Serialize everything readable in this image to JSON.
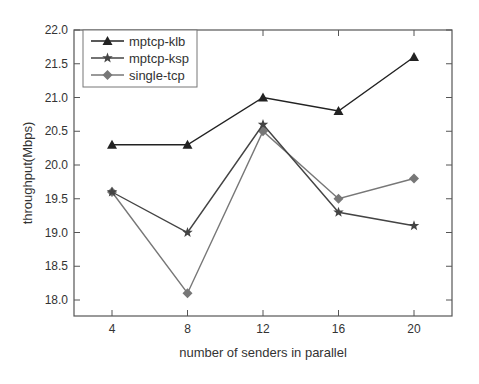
{
  "chart_data": {
    "type": "line",
    "title": "",
    "xlabel": "number of senders in parallel",
    "ylabel": "throughput(Mbps)",
    "x": [
      4,
      8,
      12,
      16,
      20
    ],
    "x_tick_labels": [
      "4",
      "8",
      "12",
      "16",
      "20"
    ],
    "y_tick_labels": [
      "18.0",
      "18.5",
      "19.0",
      "19.5",
      "20.0",
      "20.5",
      "21.0",
      "21.5",
      "22.0"
    ],
    "y_ticks": [
      18.0,
      18.5,
      19.0,
      19.5,
      20.0,
      20.5,
      21.0,
      21.5,
      22.0
    ],
    "xlim": [
      1,
      23
    ],
    "ylim": [
      17.76,
      22.0
    ],
    "grid": false,
    "legend_position": "upper-left",
    "series": [
      {
        "name": "mptcp-klb",
        "marker": "triangle",
        "color": "#222222",
        "values": [
          20.3,
          20.3,
          21.0,
          20.8,
          21.6
        ]
      },
      {
        "name": "mptcp-ksp",
        "marker": "star",
        "color": "#444444",
        "values": [
          19.6,
          19.0,
          20.6,
          19.3,
          19.1
        ]
      },
      {
        "name": "single-tcp",
        "marker": "diamond",
        "color": "#777777",
        "values": [
          19.6,
          18.1,
          20.5,
          19.5,
          19.8
        ]
      }
    ]
  }
}
